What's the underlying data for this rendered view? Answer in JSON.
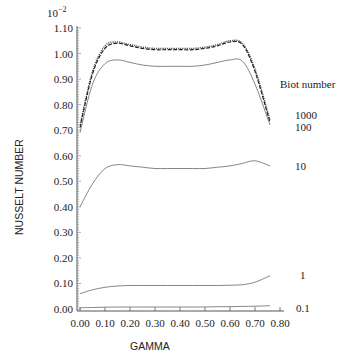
{
  "chart_data": {
    "type": "line",
    "title": "",
    "xlabel": "GAMMA",
    "ylabel": "NUSSELT NUMBER",
    "y_multiplier_label": "10^-2",
    "xlim": [
      0.0,
      0.8
    ],
    "ylim": [
      0.0,
      1.1
    ],
    "x_ticks": [
      "0.00",
      "0.10",
      "0.20",
      "0.30",
      "0.40",
      "0.50",
      "0.60",
      "0.70",
      "0.80"
    ],
    "y_ticks": [
      "0.00",
      "0.10",
      "0.20",
      "0.30",
      "0.40",
      "0.50",
      "0.60",
      "0.70",
      "0.80",
      "0.90",
      "1.00",
      "1.10"
    ],
    "grid": false,
    "legend_title": "Biot number",
    "legend_position": "right, inline labels at curve ends",
    "x": [
      0.0,
      0.05,
      0.1,
      0.15,
      0.2,
      0.25,
      0.3,
      0.35,
      0.4,
      0.45,
      0.5,
      0.55,
      0.6,
      0.65,
      0.7,
      0.76
    ],
    "series": [
      {
        "name": "1000",
        "style": "dotted",
        "values": [
          0.72,
          0.93,
          1.03,
          1.045,
          1.035,
          1.025,
          1.02,
          1.02,
          1.02,
          1.02,
          1.025,
          1.035,
          1.05,
          1.04,
          0.94,
          0.74
        ]
      },
      {
        "name": "100",
        "style": "dashed",
        "values": [
          0.71,
          0.92,
          1.02,
          1.04,
          1.03,
          1.02,
          1.015,
          1.015,
          1.015,
          1.015,
          1.02,
          1.03,
          1.045,
          1.035,
          0.93,
          0.73
        ]
      },
      {
        "name": "10 (upper)",
        "style": "solid",
        "values": [
          0.69,
          0.88,
          0.96,
          0.975,
          0.965,
          0.955,
          0.95,
          0.95,
          0.95,
          0.95,
          0.955,
          0.965,
          0.975,
          0.97,
          0.88,
          0.72
        ]
      },
      {
        "name": "10",
        "style": "solid",
        "values": [
          0.4,
          0.49,
          0.55,
          0.565,
          0.56,
          0.555,
          0.55,
          0.55,
          0.55,
          0.55,
          0.55,
          0.555,
          0.56,
          0.57,
          0.58,
          0.56
        ]
      },
      {
        "name": "1",
        "style": "solid",
        "values": [
          0.06,
          0.075,
          0.085,
          0.09,
          0.092,
          0.092,
          0.092,
          0.092,
          0.092,
          0.092,
          0.092,
          0.092,
          0.093,
          0.095,
          0.105,
          0.13
        ]
      },
      {
        "name": "0.1",
        "style": "solid",
        "values": [
          0.005,
          0.006,
          0.007,
          0.008,
          0.008,
          0.008,
          0.008,
          0.008,
          0.008,
          0.008,
          0.008,
          0.009,
          0.009,
          0.01,
          0.011,
          0.013
        ]
      }
    ]
  },
  "labels": {
    "exponent": "10",
    "exponent_power": "−2",
    "ylabel": "NUSSELT NUMBER",
    "xlabel": "GAMMA",
    "legend_title": "Biot number",
    "series_1000": "1000",
    "series_100": "100",
    "series_10": "10",
    "series_1": "1",
    "series_01": "0.1"
  },
  "colors": {
    "axis": "#555555",
    "curve_dark": "#222222",
    "curve_light": "#777777"
  }
}
